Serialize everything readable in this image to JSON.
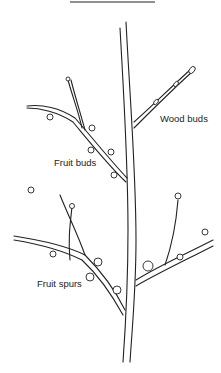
{
  "figure": {
    "labels": {
      "wood_buds": "Wood buds",
      "fruit_buds": "Fruit buds",
      "fruit_spurs": "Fruit spurs"
    },
    "colors": {
      "ink": "#222222",
      "background": "#ffffff"
    }
  }
}
